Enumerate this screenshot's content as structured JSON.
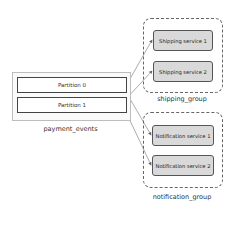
{
  "topic": {
    "name": "payment_events",
    "partitions": [
      {
        "label": "Partition 0"
      },
      {
        "label": "Partition 1"
      }
    ]
  },
  "groups": [
    {
      "name": "shipping_group",
      "services": [
        {
          "label": "Shipping service 1"
        },
        {
          "label": "Shipping service 2"
        }
      ]
    },
    {
      "name": "notification_group",
      "services": [
        {
          "label": "Notification service 1"
        },
        {
          "label": "Notification service 2"
        }
      ]
    }
  ],
  "edges": [
    {
      "from": "Partition 0",
      "to": "Shipping service 1"
    },
    {
      "from": "Partition 1",
      "to": "Shipping service 2"
    },
    {
      "from": "Partition 0",
      "to": "Notification service 1"
    },
    {
      "from": "Partition 1",
      "to": "Notification service 2"
    }
  ],
  "colors": {
    "service_fill": "#d9d9d9",
    "edge": "#888888"
  }
}
